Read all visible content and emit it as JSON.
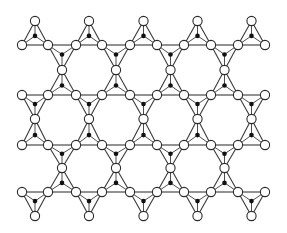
{
  "diagram": {
    "type": "tetrahedral-sheet-lattice",
    "colors": {
      "background": "#ffffff",
      "line": "#3a3a3a",
      "vertex_fill": "#ffffff",
      "vertex_stroke": "#2a2a2a",
      "center_dot": "#111111"
    },
    "vertex_radius": 4.6,
    "center_radius": 2.3,
    "row_x": [
      22,
      48,
      76,
      102,
      130,
      157,
      184,
      211,
      238,
      265
    ],
    "rows": [
      {
        "y": 45,
        "up_starts": [
          0,
          2,
          4,
          6,
          8
        ],
        "down_starts": [
          1,
          3,
          5,
          7
        ],
        "up_apex_y": 21,
        "down_apex_y": 70
      },
      {
        "y": 95,
        "up_starts": [
          1,
          3,
          5,
          7
        ],
        "down_starts": [
          0,
          2,
          4,
          6,
          8
        ],
        "up_apex_y": 70,
        "down_apex_y": 119
      },
      {
        "y": 145,
        "up_starts": [
          0,
          2,
          4,
          6,
          8
        ],
        "down_starts": [
          1,
          3,
          5,
          7
        ],
        "up_apex_y": 119,
        "down_apex_y": 168
      },
      {
        "y": 192,
        "up_starts": [
          1,
          3,
          5,
          7
        ],
        "down_starts": [
          0,
          2,
          4,
          6,
          8
        ],
        "up_apex_y": 168,
        "down_apex_y": 216
      }
    ]
  }
}
